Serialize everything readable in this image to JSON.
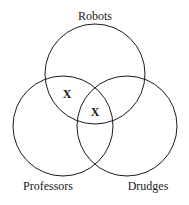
{
  "diagram": {
    "type": "venn",
    "sets": [
      {
        "label": "Robots",
        "cx": 95,
        "cy": 74,
        "r": 50
      },
      {
        "label": "Professors",
        "cx": 63,
        "cy": 126,
        "r": 50
      },
      {
        "label": "Drudges",
        "cx": 127,
        "cy": 126,
        "r": 50
      }
    ],
    "marks": [
      {
        "text": "X",
        "region": "Robots ∩ Professors (not Drudges)",
        "x": 67,
        "y": 98
      },
      {
        "text": "X",
        "region": "Robots ∩ Professors ∩ Drudges boundary",
        "x": 95,
        "y": 115
      }
    ],
    "labels": {
      "top": "Robots",
      "left": "Professors",
      "right": "Drudges"
    },
    "stroke_color": "#1a1a1a"
  }
}
